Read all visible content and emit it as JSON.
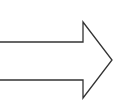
{
  "diagram": {
    "shape": "right-arrow-outline",
    "direction": "right",
    "stroke_color": "#333333",
    "fill_color": "#ffffff",
    "background": "#ffffff"
  }
}
